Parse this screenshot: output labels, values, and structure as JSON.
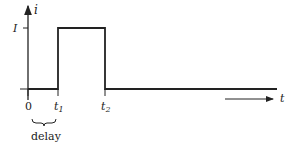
{
  "diagram": {
    "type": "pulse-waveform",
    "y_axis_label": "i",
    "x_axis_label": "t",
    "level_label": "I",
    "ticks": {
      "origin": "0",
      "t1": {
        "base": "t",
        "sub": "1"
      },
      "t2": {
        "base": "t",
        "sub": "2"
      }
    },
    "brace_label": "delay",
    "colors": {
      "stroke": "#222222",
      "background": "#ffffff"
    }
  }
}
